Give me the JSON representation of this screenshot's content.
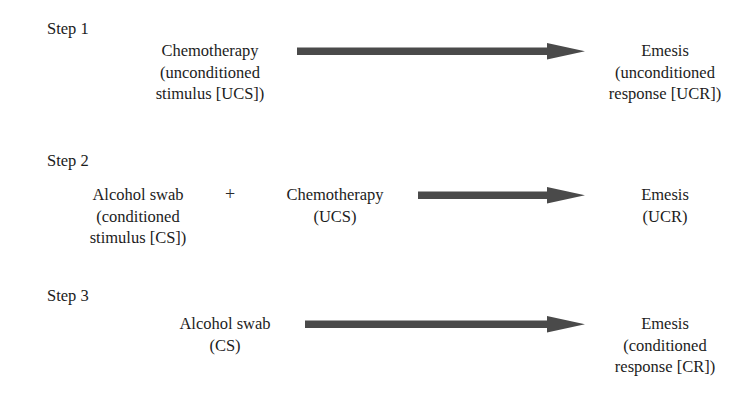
{
  "diagram": {
    "type": "process-flow",
    "arrow_color": "#4a4a4a",
    "text_color": "#1c1c1c",
    "background_color": "#ffffff",
    "conjunction_symbol": "+",
    "steps": [
      {
        "label": "Step 1",
        "stimuli": [
          {
            "lines": [
              "Chemotherapy",
              "(unconditioned",
              "stimulus [UCS])"
            ]
          }
        ],
        "response": {
          "lines": [
            "Emesis",
            "(unconditioned",
            "response [UCR])"
          ]
        }
      },
      {
        "label": "Step 2",
        "stimuli": [
          {
            "lines": [
              "Alcohol swab",
              "(conditioned",
              "stimulus [CS])"
            ]
          },
          {
            "lines": [
              "Chemotherapy",
              "(UCS)"
            ]
          }
        ],
        "response": {
          "lines": [
            "Emesis",
            "(UCR)"
          ]
        }
      },
      {
        "label": "Step 3",
        "stimuli": [
          {
            "lines": [
              "Alcohol swab",
              "(CS)"
            ]
          }
        ],
        "response": {
          "lines": [
            "Emesis",
            "(conditioned",
            "response [CR])"
          ]
        }
      }
    ]
  }
}
